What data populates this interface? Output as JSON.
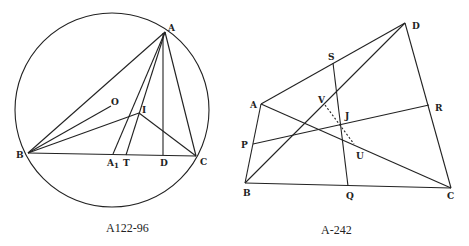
{
  "figures": [
    {
      "caption": "A122-96",
      "labels": {
        "A": "A",
        "B": "B",
        "C": "C",
        "O": "O",
        "I": "I",
        "A1": "A",
        "A1_sub": "1",
        "T": "T",
        "D": "D"
      }
    },
    {
      "caption": "A-242",
      "labels": {
        "A": "A",
        "B": "B",
        "C": "C",
        "D": "D",
        "S": "S",
        "V": "V",
        "J": "J",
        "R": "R",
        "P": "P",
        "U": "U",
        "Q": "Q"
      }
    }
  ]
}
